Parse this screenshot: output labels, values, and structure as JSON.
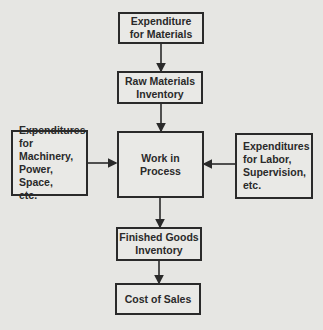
{
  "diagram": {
    "type": "flowchart",
    "nodes": [
      {
        "id": "expenditure-materials",
        "label": "Expenditure\nfor Materials"
      },
      {
        "id": "raw-materials-inventory",
        "label": "Raw Materials\nInventory"
      },
      {
        "id": "expenditures-machinery",
        "label": "Expenditures\nfor Machinery,\nPower, Space,\netc."
      },
      {
        "id": "work-in-process",
        "label": "Work in\nProcess"
      },
      {
        "id": "expenditures-labor",
        "label": "Expenditures\nfor Labor,\nSupervision,\netc."
      },
      {
        "id": "finished-goods-inventory",
        "label": "Finished Goods\nInventory"
      },
      {
        "id": "cost-of-sales",
        "label": "Cost of Sales"
      }
    ],
    "edges": [
      {
        "from": "expenditure-materials",
        "to": "raw-materials-inventory"
      },
      {
        "from": "raw-materials-inventory",
        "to": "work-in-process"
      },
      {
        "from": "expenditures-machinery",
        "to": "work-in-process"
      },
      {
        "from": "expenditures-labor",
        "to": "work-in-process"
      },
      {
        "from": "work-in-process",
        "to": "finished-goods-inventory"
      },
      {
        "from": "finished-goods-inventory",
        "to": "cost-of-sales"
      }
    ]
  }
}
